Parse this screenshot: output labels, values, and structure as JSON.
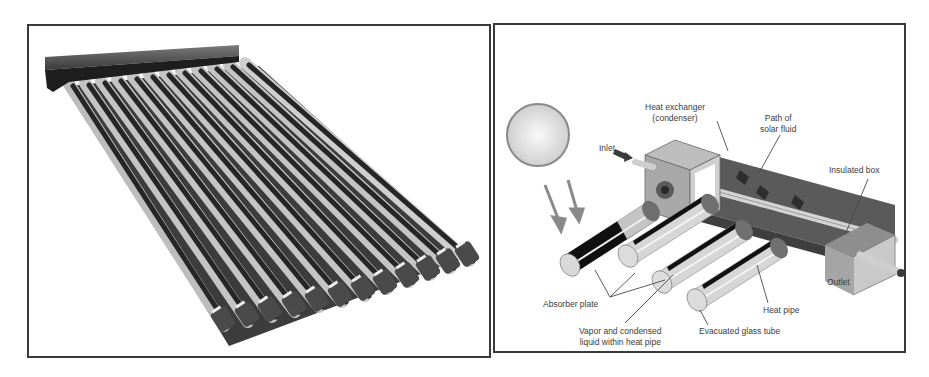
{
  "figure": {
    "left_panel": {
      "subject": "evacuated-tube solar collector photo",
      "tube_count": 12
    },
    "right_panel": {
      "subject": "heat-pipe evacuated tube collector schematic",
      "labels": {
        "heat_exchanger_line1": "Heat exchanger",
        "heat_exchanger_line2": "(condenser)",
        "path_line1": "Path of",
        "path_line2": "solar fluid",
        "inlet": "Inlet",
        "insulated_box": "Insulated box",
        "outlet": "Outlet",
        "absorber_plate": "Absorber plate",
        "heat_pipe": "Heat pipe",
        "vapor_line1": "Vapor and condensed",
        "vapor_line2": "liquid within heat pipe",
        "evacuated_tube": "Evacuated glass tube"
      }
    }
  },
  "colors": {
    "frame_border": "#3a3a3a",
    "label_text": "#3c3c3c",
    "tube_dark": "#2a2a2a",
    "tube_light": "#c8c8c8",
    "header_bar": "#555555",
    "box_dark": "#5a5a5a",
    "box_light": "#bdbdbd"
  }
}
